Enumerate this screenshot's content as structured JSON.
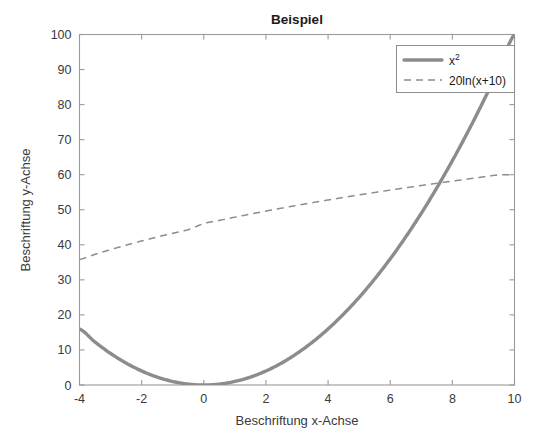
{
  "chart_data": {
    "type": "line",
    "title": "Beispiel",
    "xlabel": "Beschriftung x-Achse",
    "ylabel": "Beschriftung y-Achse",
    "xlim": [
      -4,
      10
    ],
    "ylim": [
      0,
      100
    ],
    "xticks": [
      -4,
      -2,
      0,
      2,
      4,
      6,
      8,
      10
    ],
    "xticklabels": [
      "-4",
      "-2",
      "0",
      "2",
      "4",
      "6",
      "8",
      "10"
    ],
    "yticks": [
      0,
      10,
      20,
      30,
      40,
      50,
      60,
      70,
      80,
      90,
      100
    ],
    "yticklabels": [
      "0",
      "10",
      "20",
      "30",
      "40",
      "50",
      "60",
      "70",
      "80",
      "90",
      "100"
    ],
    "grid": false,
    "legend_position": "top-right-inside",
    "series": [
      {
        "name": "x^2",
        "legend_text": "x",
        "legend_superscript": "2",
        "style": "solid",
        "color": "#8c8c8c",
        "linewidth": 3.4,
        "formula": "x^2",
        "x": [
          -4,
          -3.5,
          -3,
          -2.5,
          -2,
          -1.5,
          -1,
          -0.5,
          0,
          0.5,
          1,
          1.5,
          2,
          2.5,
          3,
          3.5,
          4,
          4.5,
          5,
          5.5,
          6,
          6.5,
          7,
          7.5,
          8,
          8.5,
          9,
          9.5,
          10
        ],
        "values": [
          16,
          12.25,
          9,
          6.25,
          4,
          2.25,
          1,
          0.25,
          0,
          0.25,
          1,
          2.25,
          4,
          6.25,
          9,
          12.25,
          16,
          20.25,
          25,
          30.25,
          36,
          42.25,
          49,
          56.25,
          64,
          72.25,
          81,
          90.25,
          100
        ]
      },
      {
        "name": "20ln(x+10)",
        "legend_text": "20ln(x+10)",
        "style": "dashed",
        "color": "#8c8c8c",
        "linewidth": 1.5,
        "formula": "20*ln(x+10)",
        "x": [
          -4,
          -3.5,
          -3,
          -2.5,
          -2,
          -1.5,
          -1,
          -0.5,
          0,
          0.5,
          1,
          1.5,
          2,
          2.5,
          3,
          3.5,
          4,
          4.5,
          5,
          5.5,
          6,
          6.5,
          7,
          7.5,
          8,
          8.5,
          9,
          9.5,
          10
        ],
        "values": [
          35.84,
          37.28,
          38.63,
          39.89,
          41.09,
          42.22,
          43.29,
          44.32,
          46.05,
          46.96,
          47.88,
          48.76,
          49.62,
          50.45,
          51.25,
          52.03,
          52.79,
          53.52,
          54.24,
          54.93,
          55.61,
          56.27,
          56.92,
          57.55,
          58.17,
          58.78,
          59.37,
          59.95,
          59.91
        ]
      }
    ],
    "intersection_note": "curves cross near x = 7.5, y = 57"
  },
  "colors": {
    "axis": "#9a9a9a",
    "text": "#3a3a3a",
    "title": "#1a1a1a",
    "series": "#8c8c8c",
    "background": "#ffffff"
  }
}
